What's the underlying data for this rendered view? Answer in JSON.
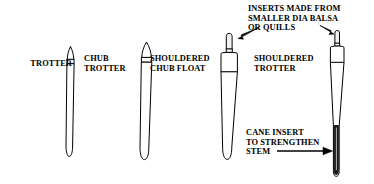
{
  "figure": {
    "title_alt": "Fishing float types line drawing",
    "background_color": "#ffffff",
    "line_color": "#000000",
    "fill_color": "#ffffff",
    "insert_fill_color": "#f2f2f2",
    "cane_fill_color": "#1a1a1a"
  },
  "labels": {
    "trotter": "TROTTER",
    "chub_trotter": "CHUB\nTROTTER",
    "shouldered_chub_float": "SHOULDERED\nCHUB FLOAT",
    "shouldered_trotter": "SHOULDERED\nTROTTER",
    "inserts_note": "INSERTS MADE FROM\nSMALLER DIA BALSA\nOR QUILLS",
    "cane_note": "CANE INSERT\nTO STRENGTHEN\nSTEM"
  },
  "floats": [
    {
      "name": "trotter",
      "label": "TROTTER",
      "tip_style": "pointed",
      "has_ring_band": true,
      "has_shoulder": false,
      "has_cane_insert": false
    },
    {
      "name": "chub-trotter",
      "label": "CHUB TROTTER",
      "tip_style": "pointed",
      "has_ring_band": true,
      "has_shoulder": false,
      "has_cane_insert": false
    },
    {
      "name": "shouldered-chub-float",
      "label": "SHOULDERED CHUB FLOAT",
      "tip_style": "insert-cylinder",
      "has_ring_band": true,
      "has_shoulder": true,
      "has_cane_insert": false
    },
    {
      "name": "shouldered-trotter",
      "label": "SHOULDERED TROTTER",
      "tip_style": "insert-cylinder",
      "has_ring_band": true,
      "has_shoulder": true,
      "has_cane_insert": true
    }
  ],
  "annotations": [
    {
      "name": "inserts-callout",
      "text": "INSERTS MADE FROM SMALLER DIA BALSA OR QUILLS",
      "arrow_count": 2,
      "points_to": [
        "shouldered-chub-float-insert",
        "shouldered-trotter-insert"
      ]
    },
    {
      "name": "cane-callout",
      "text": "CANE INSERT TO STRENGTHEN STEM",
      "arrow_count": 1,
      "points_to": [
        "shouldered-trotter-cane-insert"
      ]
    }
  ]
}
